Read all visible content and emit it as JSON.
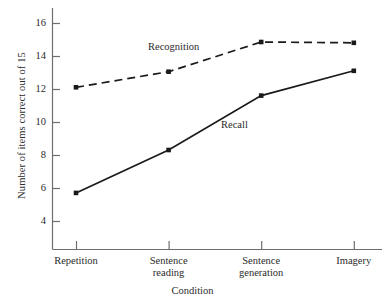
{
  "chart_data": {
    "type": "line",
    "title": "",
    "xlabel": "Condition",
    "ylabel": "Number of items correct out of 15",
    "categories": [
      "Repetition",
      "Sentence reading",
      "Sentence generation",
      "Imagery"
    ],
    "category_lines": [
      [
        "Repetition"
      ],
      [
        "Sentence",
        "reading"
      ],
      [
        "Sentence",
        "generation"
      ],
      [
        "Imagery"
      ]
    ],
    "series": [
      {
        "name": "Recognition",
        "values": [
          12.1,
          13.05,
          14.85,
          14.8
        ],
        "line_style": "dashed",
        "marker": "filled-square",
        "color": "#1a1a1a"
      },
      {
        "name": "Recall",
        "values": [
          5.7,
          8.3,
          11.6,
          13.1
        ],
        "line_style": "solid",
        "marker": "filled-square",
        "color": "#1a1a1a"
      }
    ],
    "ylim": [
      3.0,
      16.9
    ],
    "yticks": [
      4,
      6,
      8,
      10,
      12,
      14,
      16
    ],
    "ytick_labels": [
      "4",
      "6",
      "8",
      "10",
      "12",
      "14",
      "16"
    ],
    "grid": false,
    "legend": "inline-annotations",
    "annotations": [
      {
        "text": "Recognition",
        "series": "Recognition"
      },
      {
        "text": "Recall",
        "series": "Recall"
      }
    ]
  },
  "axis_colors": {
    "axis_line": "#6e6e6e",
    "series_line": "#1a1a1a",
    "text": "#2b2b2b",
    "background": "#ffffff"
  }
}
